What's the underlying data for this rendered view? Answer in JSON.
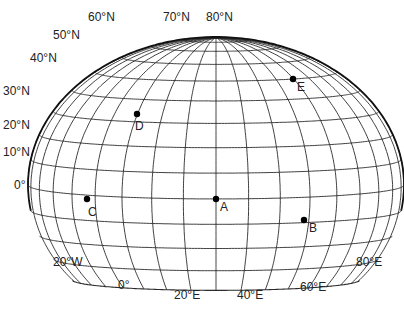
{
  "diagram": {
    "title": "",
    "type": "globe-graticule",
    "colors": {
      "line": "#2a2a2a",
      "rim": "#111111",
      "point": "#000000",
      "text": "#222222",
      "background": "#ffffff"
    },
    "projection": {
      "cx": 216,
      "cy": 185,
      "rx": 188,
      "ry": 148,
      "view_lat": 5.4,
      "view_lon": 30,
      "lat_min": -40,
      "lat_max": 80,
      "lat_step": 10,
      "lon_min": -60,
      "lon_max": 120,
      "lon_step": 10
    },
    "latitude_labels": [
      {
        "text": "0°",
        "x": 14,
        "y": 185
      },
      {
        "text": "10°N",
        "x": 3,
        "y": 152
      },
      {
        "text": "20°N",
        "x": 3,
        "y": 125
      },
      {
        "text": "30°N",
        "x": 3,
        "y": 91
      },
      {
        "text": "40°N",
        "x": 30,
        "y": 58
      },
      {
        "text": "50°N",
        "x": 53,
        "y": 35
      },
      {
        "text": "60°N",
        "x": 88,
        "y": 17
      },
      {
        "text": "70°N",
        "x": 163,
        "y": 17
      },
      {
        "text": "80°N",
        "x": 206,
        "y": 17
      }
    ],
    "longitude_labels": [
      {
        "text": "20°W",
        "x": 53,
        "y": 262
      },
      {
        "text": "0°",
        "x": 118,
        "y": 285
      },
      {
        "text": "20°E",
        "x": 174,
        "y": 295
      },
      {
        "text": "40°E",
        "x": 237,
        "y": 295
      },
      {
        "text": "60°E",
        "x": 300,
        "y": 287
      },
      {
        "text": "80°E",
        "x": 356,
        "y": 262
      }
    ],
    "points": [
      {
        "label": "A",
        "x": 216,
        "y": 199,
        "lx": 220,
        "ly": 201
      },
      {
        "label": "B",
        "x": 304,
        "y": 220,
        "lx": 309,
        "ly": 222
      },
      {
        "label": "C",
        "x": 87,
        "y": 199,
        "lx": 88,
        "ly": 206
      },
      {
        "label": "D",
        "x": 137,
        "y": 114,
        "lx": 135,
        "ly": 120
      },
      {
        "label": "E",
        "x": 293,
        "y": 79,
        "lx": 297,
        "ly": 81
      }
    ]
  }
}
